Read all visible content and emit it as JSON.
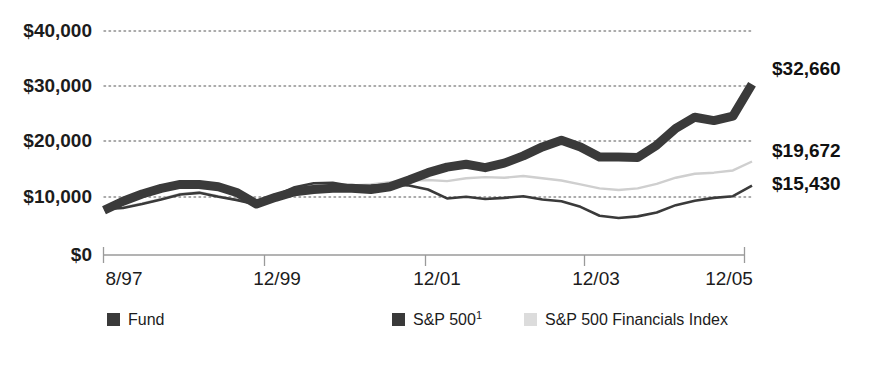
{
  "chart_data": {
    "type": "line",
    "title": "",
    "subtitle": "",
    "xlabel": "",
    "ylabel": "",
    "ylim": [
      0,
      40000
    ],
    "yticks": [
      0,
      10000,
      20000,
      30000,
      40000
    ],
    "ytick_labels": [
      "$0",
      "$10,000",
      "$20,000",
      "$30,000",
      "$40,000"
    ],
    "xtick_labels": [
      "8/97",
      "12/99",
      "12/01",
      "12/03",
      "12/05"
    ],
    "xtick_values": [
      0,
      8,
      16,
      24,
      32
    ],
    "xlim": [
      0,
      34
    ],
    "grid": "horizontal-dotted",
    "legend_position": "bottom",
    "end_labels": [
      {
        "text": "$32,660",
        "series": "Fund",
        "value": 32660
      },
      {
        "text": "$19,672",
        "series": "S&P 500 Financials Index",
        "value": 19672
      },
      {
        "text": "$15,430",
        "series": "S&P 500",
        "value": 15430
      }
    ],
    "series": [
      {
        "name": "Fund",
        "color": "#3a3a3a",
        "style": "thick",
        "x": [
          0,
          1,
          2,
          3,
          4,
          5,
          6,
          7,
          8,
          9,
          10,
          11,
          12,
          13,
          14,
          15,
          16,
          17,
          18,
          19,
          20,
          21,
          22,
          23,
          24,
          25,
          26,
          27,
          28,
          29,
          30,
          31,
          32,
          33
        ],
        "values": [
          8000,
          9600,
          10900,
          11900,
          12600,
          12600,
          12200,
          11100,
          9100,
          10300,
          11300,
          11700,
          11900,
          11900,
          11700,
          12200,
          13400,
          14700,
          15700,
          16200,
          15600,
          16400,
          17700,
          19300,
          20500,
          19300,
          17500,
          17500,
          17400,
          19600,
          22600,
          24600,
          24000,
          24800
        ]
      },
      {
        "name": "S&P 500",
        "color": "#3a3a3a",
        "style": "thin",
        "x": [
          0,
          1,
          2,
          3,
          4,
          5,
          6,
          7,
          8,
          9,
          10,
          11,
          12,
          13,
          14,
          15,
          16,
          17,
          18,
          19,
          20,
          21,
          22,
          23,
          24,
          25,
          26,
          27,
          28,
          29,
          30,
          31,
          32,
          33
        ],
        "values": [
          8200,
          8400,
          9100,
          9900,
          10800,
          11100,
          10400,
          9800,
          9000,
          10600,
          12100,
          12800,
          12900,
          12300,
          12400,
          12600,
          12400,
          11700,
          10100,
          10400,
          10000,
          10200,
          10500,
          9900,
          9600,
          8600,
          7000,
          6600,
          6900,
          7600,
          8900,
          9700,
          10200,
          10500
        ]
      },
      {
        "name": "S&P 500 Financials Index",
        "color": "#cfcfcf",
        "style": "thin",
        "x": [
          0,
          1,
          2,
          3,
          4,
          5,
          6,
          7,
          8,
          9,
          10,
          11,
          12,
          13,
          14,
          15,
          16,
          17,
          18,
          19,
          20,
          21,
          22,
          23,
          24,
          25,
          26,
          27,
          28,
          29,
          30,
          31,
          32,
          33
        ],
        "values": [
          8200,
          8500,
          9200,
          10000,
          10900,
          11200,
          10500,
          9800,
          9000,
          10500,
          11900,
          12500,
          12700,
          12400,
          12600,
          13000,
          13300,
          13400,
          13200,
          13700,
          13900,
          13800,
          14100,
          13700,
          13300,
          12600,
          11900,
          11600,
          11900,
          12700,
          13800,
          14500,
          14700,
          15100
        ]
      }
    ],
    "series_final": {
      "fund_last": 30500,
      "sp500_last": 12400,
      "fin_last": 16700
    }
  },
  "legend": {
    "items": [
      {
        "label": "Fund",
        "swatch": "dark",
        "superscript": ""
      },
      {
        "label": "S&P 500",
        "swatch": "dark",
        "superscript": "1"
      },
      {
        "label": "S&P 500 Financials Index",
        "swatch": "light",
        "superscript": ""
      }
    ]
  },
  "colors": {
    "fund": "#3a3a3a",
    "sp500": "#3a3a3a",
    "financials": "#cfcfcf",
    "grid": "#8f8f8f",
    "axis": "#9a9a9a",
    "text": "#1c1c1c",
    "background": "#ffffff"
  }
}
